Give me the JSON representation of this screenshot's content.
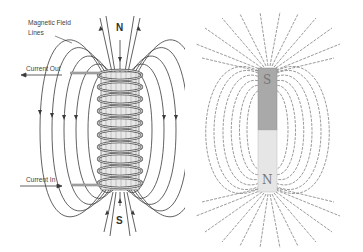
{
  "left_diagram": {
    "title": "Solenoid magnetic field",
    "labels": {
      "field_lines": [
        "Magnetic Field",
        "Lines"
      ],
      "current_out": "Current Out",
      "current_in": "Current In",
      "north": "N",
      "south": "S"
    },
    "colors": {
      "line": "#3a3a3a",
      "coil": "#555555",
      "coil_fill": "#dcdcdc"
    }
  },
  "right_diagram": {
    "title": "Bar magnet with iron filings",
    "labels": {
      "top_pole": "S",
      "bottom_pole": "N"
    },
    "colors": {
      "filings": "#6a6a6a",
      "magnet_top": "#a9a9a9",
      "magnet_bottom": "#e6e6e6"
    }
  }
}
